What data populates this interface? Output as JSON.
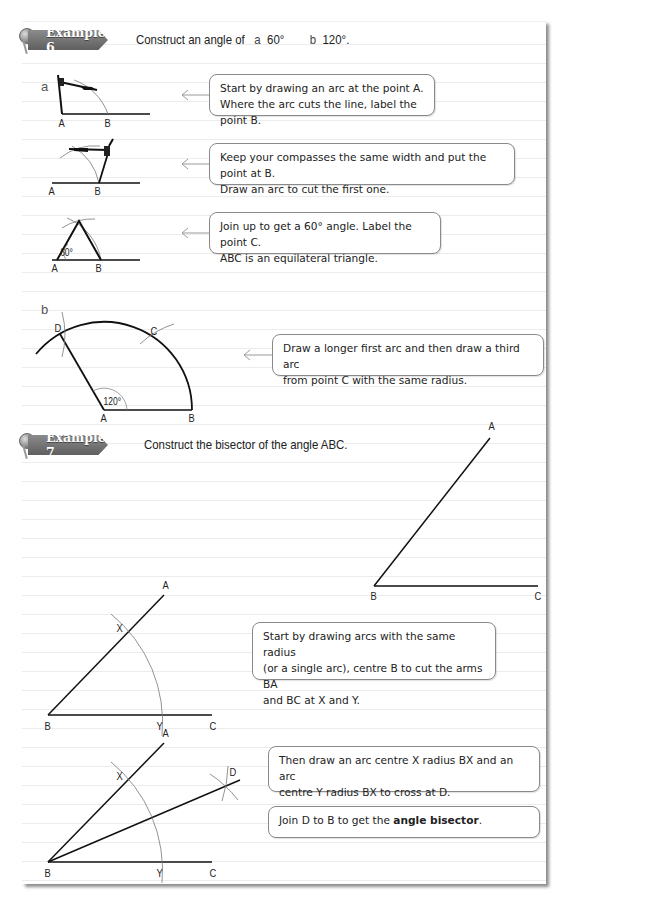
{
  "examples": [
    {
      "tab_label": "Example 6",
      "prompt": "Construct an angle of",
      "parts": [
        {
          "label": "a",
          "value": "60°"
        },
        {
          "label": "b",
          "value": "120°."
        }
      ],
      "steps": [
        {
          "part": "a",
          "figure_labels": [
            "A",
            "B"
          ],
          "callout_lines": [
            "Start by drawing an arc at the point A.",
            "Where the arc cuts the line, label the point B."
          ]
        },
        {
          "figure_labels": [
            "A",
            "B"
          ],
          "callout_lines": [
            "Keep your compasses the same width and put the point at B.",
            "Draw an arc to cut the first one."
          ]
        },
        {
          "figure_labels": [
            "A",
            "B"
          ],
          "angle_label": "60°",
          "callout_lines": [
            "Join up to get a 60° angle. Label the point C.",
            "ABC is an equilateral triangle."
          ]
        },
        {
          "part": "b",
          "figure_labels": [
            "D",
            "C",
            "A",
            "B"
          ],
          "angle_label": "120°",
          "callout_lines": [
            "Draw a longer first arc and then draw a third arc",
            "from point C with the same radius."
          ]
        }
      ]
    },
    {
      "tab_label": "Example 7",
      "prompt": "Construct the bisector of the angle ABC.",
      "figure_labels": [
        "A",
        "B",
        "C"
      ],
      "steps": [
        {
          "figure_labels": [
            "A",
            "X",
            "B",
            "Y",
            "C"
          ],
          "callout_lines": [
            "Start by drawing arcs with the same radius",
            "(or a single arc), centre B to cut the arms BA",
            "and BC at X and Y."
          ]
        },
        {
          "figure_labels": [
            "A",
            "X",
            "D",
            "B",
            "Y",
            "C"
          ],
          "callout_lines": [
            "Then draw an arc centre X radius BX and an arc",
            "centre Y radius BX to cross at D."
          ],
          "callout2_prefix": "Join D to B to get the ",
          "callout2_bold": "angle bisector",
          "callout2_suffix": "."
        }
      ]
    }
  ],
  "colors": {
    "tab_bg": "#6e6e6e",
    "callout_border": "#8a8a8a",
    "arrow": "#9a9a9a",
    "rule_line": "#ececec"
  }
}
